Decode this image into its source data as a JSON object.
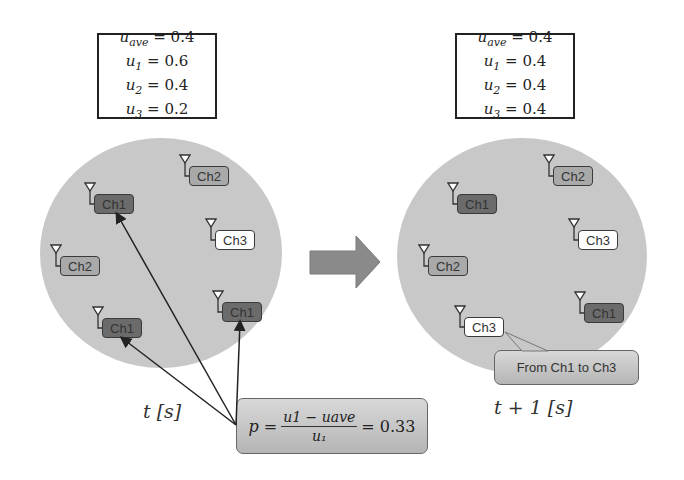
{
  "left_panel": {
    "values_box": {
      "rows": [
        {
          "var": "u",
          "sub": "ave",
          "eq": " = 0.4"
        },
        {
          "var": "u",
          "sub": "1",
          "eq": " = 0.6"
        },
        {
          "var": "u",
          "sub": "2",
          "eq": " = 0.4"
        },
        {
          "var": "u",
          "sub": "3",
          "eq": " = 0.2"
        }
      ]
    },
    "nodes": [
      {
        "label": "Ch1",
        "channel": 1
      },
      {
        "label": "Ch2",
        "channel": 2
      },
      {
        "label": "Ch3",
        "channel": 3
      },
      {
        "label": "Ch2",
        "channel": 2
      },
      {
        "label": "Ch1",
        "channel": 1
      },
      {
        "label": "Ch1",
        "channel": 1
      }
    ],
    "time_label": "t [s]"
  },
  "right_panel": {
    "values_box": {
      "rows": [
        {
          "var": "u",
          "sub": "ave",
          "eq": " = 0.4"
        },
        {
          "var": "u",
          "sub": "1",
          "eq": " = 0.4"
        },
        {
          "var": "u",
          "sub": "2",
          "eq": " = 0.4"
        },
        {
          "var": "u",
          "sub": "3",
          "eq": " = 0.4"
        }
      ]
    },
    "nodes": [
      {
        "label": "Ch1",
        "channel": 1
      },
      {
        "label": "Ch2",
        "channel": 2
      },
      {
        "label": "Ch3",
        "channel": 3
      },
      {
        "label": "Ch2",
        "channel": 2
      },
      {
        "label": "Ch3",
        "channel": 3
      },
      {
        "label": "Ch1",
        "channel": 1
      }
    ],
    "time_label": "t + 1 [s]",
    "note": "From Ch1 to Ch3"
  },
  "formula": {
    "lhs": "p =",
    "numerator": "u₁ − uₐᵥₑ",
    "numerator_display": "u1 − uave",
    "denominator": "u₁",
    "rhs": "= 0.33"
  },
  "colors": {
    "ch1": "#6b6b6b",
    "ch2": "#a9a9a9",
    "ch3": "#ffffff",
    "cell": "#c8c8c8",
    "arrow": "#8a8a8a"
  }
}
